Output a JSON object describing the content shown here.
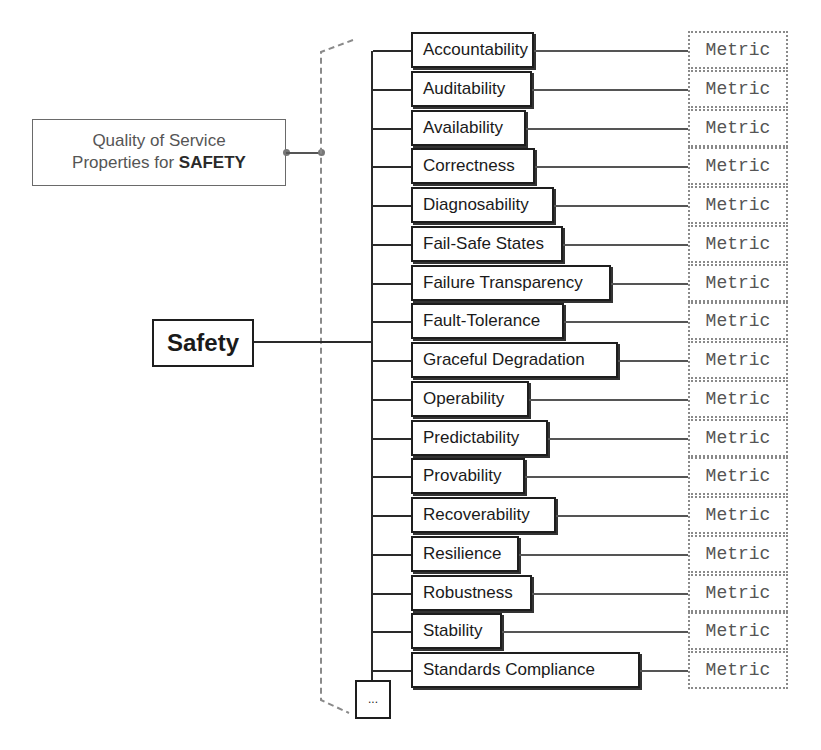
{
  "diagram": {
    "root": {
      "label": "Safety"
    },
    "annotation": {
      "line1": "Quality of Service",
      "line2_prefix": "Properties for ",
      "line2_bold": "SAFETY"
    },
    "properties": [
      {
        "label": "Accountability",
        "width": 123,
        "metric": "Metric"
      },
      {
        "label": "Auditability",
        "width": 121,
        "metric": "Metric"
      },
      {
        "label": "Availability",
        "width": 115,
        "metric": "Metric"
      },
      {
        "label": "Correctness",
        "width": 124,
        "metric": "Metric"
      },
      {
        "label": "Diagnosability",
        "width": 143,
        "metric": "Metric"
      },
      {
        "label": "Fail-Safe States",
        "width": 152,
        "metric": "Metric"
      },
      {
        "label": "Failure Transparency",
        "width": 200,
        "metric": "Metric"
      },
      {
        "label": "Fault-Tolerance",
        "width": 153,
        "metric": "Metric"
      },
      {
        "label": "Graceful Degradation",
        "width": 207,
        "metric": "Metric"
      },
      {
        "label": "Operability",
        "width": 118,
        "metric": "Metric"
      },
      {
        "label": "Predictability",
        "width": 137,
        "metric": "Metric"
      },
      {
        "label": "Provability",
        "width": 114,
        "metric": "Metric"
      },
      {
        "label": "Recoverability",
        "width": 145,
        "metric": "Metric"
      },
      {
        "label": "Resilience",
        "width": 108,
        "metric": "Metric"
      },
      {
        "label": "Robustness",
        "width": 121,
        "metric": "Metric"
      },
      {
        "label": "Stability",
        "width": 91,
        "metric": "Metric"
      },
      {
        "label": "Standards Compliance",
        "width": 229,
        "metric": "Metric"
      }
    ],
    "more": {
      "label": "..."
    }
  }
}
